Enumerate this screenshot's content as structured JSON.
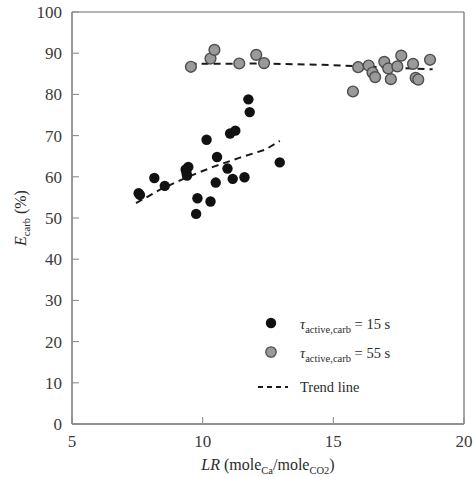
{
  "chart_data": {
    "type": "scatter",
    "title": "",
    "xlabel": "LR (mole_Ca/mole_CO2)",
    "ylabel": "E_carb (%)",
    "xlim": [
      5,
      20
    ],
    "ylim": [
      0,
      100
    ],
    "xticks": [
      5,
      10,
      15,
      20
    ],
    "yticks": [
      0,
      10,
      20,
      30,
      40,
      50,
      60,
      70,
      80,
      90,
      100
    ],
    "grid": false,
    "legend_position": "lower-right",
    "series": [
      {
        "name": "tau_active,carb = 15 s",
        "marker": "filled-circle",
        "color": "#111111",
        "points": [
          [
            7.55,
            56.0
          ],
          [
            7.6,
            55.6
          ],
          [
            8.15,
            59.7
          ],
          [
            8.55,
            57.8
          ],
          [
            9.35,
            61.8
          ],
          [
            9.38,
            61.0
          ],
          [
            9.4,
            60.3
          ],
          [
            9.45,
            62.4
          ],
          [
            9.75,
            51.0
          ],
          [
            9.8,
            54.8
          ],
          [
            10.15,
            69.0
          ],
          [
            10.3,
            54.0
          ],
          [
            10.5,
            58.6
          ],
          [
            10.55,
            64.8
          ],
          [
            10.95,
            62.0
          ],
          [
            11.05,
            70.5
          ],
          [
            11.15,
            59.5
          ],
          [
            11.25,
            71.2
          ],
          [
            11.6,
            59.9
          ],
          [
            11.75,
            78.8
          ],
          [
            11.8,
            75.7
          ],
          [
            12.95,
            63.5
          ]
        ]
      },
      {
        "name": "tau_active,carb = 55 s",
        "marker": "open-circle",
        "color": "#9a9a9a",
        "points": [
          [
            9.55,
            86.7
          ],
          [
            10.3,
            88.7
          ],
          [
            10.45,
            90.8
          ],
          [
            11.4,
            87.5
          ],
          [
            12.05,
            89.6
          ],
          [
            12.35,
            87.6
          ],
          [
            15.75,
            80.7
          ],
          [
            15.95,
            86.6
          ],
          [
            16.35,
            87.0
          ],
          [
            16.5,
            85.3
          ],
          [
            16.6,
            84.2
          ],
          [
            16.95,
            87.9
          ],
          [
            17.1,
            86.3
          ],
          [
            17.2,
            83.7
          ],
          [
            17.45,
            86.8
          ],
          [
            17.6,
            89.4
          ],
          [
            18.05,
            87.4
          ],
          [
            18.15,
            84.0
          ],
          [
            18.25,
            83.6
          ],
          [
            18.7,
            88.4
          ]
        ]
      }
    ],
    "trend_lines": [
      {
        "name": "Trend line (15 s)",
        "style": "dashed",
        "color": "#1a1a1a",
        "x": [
          7.45,
          8.4,
          9.4,
          10.4,
          11.4,
          12.4,
          12.95
        ],
        "y": [
          53.6,
          57.0,
          59.9,
          62.4,
          64.6,
          66.6,
          68.7
        ]
      },
      {
        "name": "Trend line (55 s)",
        "style": "dashed",
        "color": "#1a1a1a",
        "x": [
          9.5,
          12.0,
          14.5,
          16.5,
          18.8
        ],
        "y": [
          87.4,
          87.5,
          87.2,
          86.7,
          86.1
        ]
      }
    ]
  },
  "legend": {
    "items": [
      {
        "marker": "black-dot-marker",
        "symbol": "τ",
        "sub": "active,carb",
        "eq": " = 15 s"
      },
      {
        "marker": "gray-dot-marker",
        "symbol": "τ",
        "sub": "active,carb",
        "eq": " = 55 s"
      },
      {
        "marker": "dashed-line-marker",
        "label": "Trend line"
      }
    ]
  },
  "axis": {
    "x": {
      "label_main": "LR",
      "label_open": " (mole",
      "label_sub1": "Ca",
      "label_slash": "/mole",
      "label_sub2": "CO2",
      "label_close": ")",
      "tick_labels": [
        "5",
        "10",
        "15",
        "20"
      ]
    },
    "y": {
      "label_main": "E",
      "label_sub": "carb",
      "label_unit": " (%)",
      "tick_labels": [
        "0",
        "10",
        "20",
        "30",
        "40",
        "50",
        "60",
        "70",
        "80",
        "90",
        "100"
      ]
    }
  },
  "colors": {
    "series1": "#111111",
    "series2": "#9a9a9a",
    "series2_stroke": "#4d4d4d",
    "axis": "#6e6e6e",
    "text": "#2b2b2b",
    "background": "#ffffff"
  }
}
